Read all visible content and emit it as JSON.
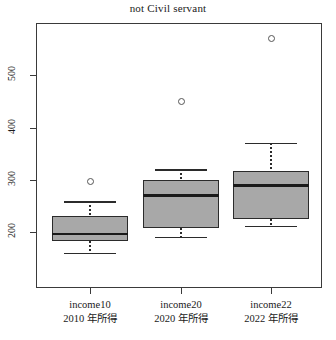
{
  "chart_data": {
    "type": "box",
    "title": "not Civil servant",
    "xlabel": "",
    "ylabel": "",
    "ylim": [
      150,
      590
    ],
    "yticks": [
      200,
      300,
      400,
      500
    ],
    "grid": false,
    "legend": "none",
    "categories": [
      "income10",
      "income20",
      "income22"
    ],
    "category_sublabels": [
      "2010 年所得",
      "2020 年所得",
      "2022 年所得"
    ],
    "boxes": [
      {
        "name": "income10",
        "whisker_low": 160,
        "q1": 183,
        "median": 196,
        "q3": 231,
        "whisker_high": 259,
        "outliers": [
          296
        ]
      },
      {
        "name": "income20",
        "whisker_low": 191,
        "q1": 207,
        "median": 270,
        "q3": 300,
        "whisker_high": 320,
        "outliers": [
          450
        ]
      },
      {
        "name": "income22",
        "whisker_low": 212,
        "q1": 224,
        "median": 289,
        "q3": 317,
        "whisker_high": 370,
        "outliers": [
          570
        ]
      }
    ],
    "colors": {
      "box_fill": "#a8a8a8",
      "box_edge": "#2b2b2b",
      "median": "#1a1a1a",
      "outlier_edge": "#555555",
      "frame": "#3a3a3a",
      "background": "#ffffff"
    }
  },
  "axis": {
    "y_tick_labels": [
      "500",
      "400",
      "300",
      "200"
    ],
    "x_tick_labels": [
      "income10",
      "income20",
      "income22"
    ]
  }
}
